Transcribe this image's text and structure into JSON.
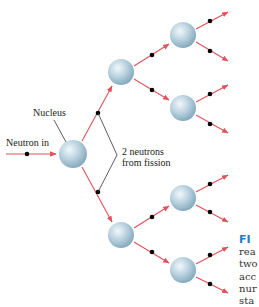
{
  "diagram": {
    "labels": {
      "neutron_in": "Neutron in",
      "nucleus": "Nucleus",
      "two_neutrons_line1": "2 neutrons",
      "two_neutrons_line2": "from fission"
    },
    "colors": {
      "arrow": "#e0525a",
      "neutron_dot": "#000000",
      "nucleus_fill": "#a9c6d6",
      "leader_line": "#333333",
      "caption_accent": "#2a7bc0"
    },
    "nuclei": [
      {
        "id": "gen0",
        "x": 73,
        "y": 154,
        "r": 14
      },
      {
        "id": "gen1-top",
        "x": 121,
        "y": 72,
        "r": 13
      },
      {
        "id": "gen1-bottom",
        "x": 121,
        "y": 235,
        "r": 13
      },
      {
        "id": "gen2-a",
        "x": 183,
        "y": 35,
        "r": 13
      },
      {
        "id": "gen2-b",
        "x": 183,
        "y": 108,
        "r": 13
      },
      {
        "id": "gen2-c",
        "x": 183,
        "y": 198,
        "r": 13
      },
      {
        "id": "gen2-d",
        "x": 183,
        "y": 270,
        "r": 13
      }
    ]
  },
  "caption": {
    "figure_label": "FI",
    "lines": [
      "rea",
      "two",
      "acc",
      "nur",
      "sta"
    ]
  }
}
